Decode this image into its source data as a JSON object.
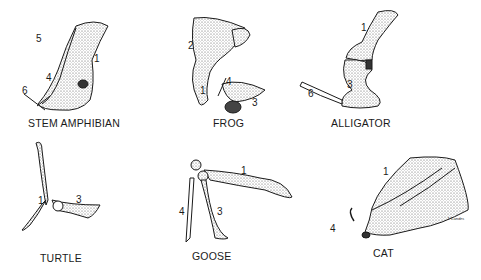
{
  "panels": [
    {
      "name": "STEM AMPHIBIAN",
      "labels": [
        "5",
        "1",
        "4",
        "6"
      ]
    },
    {
      "name": "FROG",
      "labels": [
        "2",
        "4",
        "1",
        "3"
      ]
    },
    {
      "name": "ALLIGATOR",
      "labels": [
        "1",
        "3",
        "6"
      ]
    },
    {
      "name": "TURTLE",
      "labels": [
        "1",
        "3"
      ]
    },
    {
      "name": "GOOSE",
      "labels": [
        "1",
        "4",
        "3"
      ]
    },
    {
      "name": "CAT",
      "labels": [
        "1",
        "4"
      ]
    }
  ],
  "signature": "J. Landes",
  "colors": {
    "ink": "#1a1a1a",
    "stipple": "#d9d9d9",
    "background": "#ffffff"
  }
}
